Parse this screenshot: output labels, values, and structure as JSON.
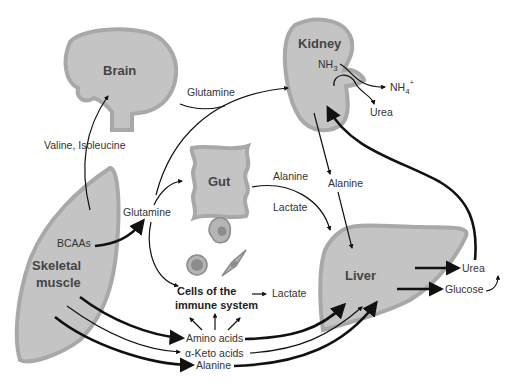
{
  "organs": {
    "brain": "Brain",
    "kidney": "Kidney",
    "gut": "Gut",
    "skeletal_muscle_line1": "Skeletal",
    "skeletal_muscle_line2": "muscle",
    "liver": "Liver",
    "immune_line1": "Cells of the",
    "immune_line2": "immune system"
  },
  "labels": {
    "valine_isoleucine": "Valine, Isoleucine",
    "glutamine_to_kidney": "Glutamine",
    "glutamine_center": "Glutamine",
    "bcaas": "BCAAs",
    "nh3_base": "NH",
    "nh3_sub": "3",
    "nh4_base": "NH",
    "nh4_sub": "4",
    "nh4_sup": "+",
    "kidney_urea": "Urea",
    "gut_alanine": "Alanine",
    "gut_lactate": "Lactate",
    "kidney_alanine": "Alanine",
    "immune_lactate": "Lactate",
    "amino_acids": "Amino acids",
    "alpha_keto_acids": "α-Keto acids",
    "alanine_bottom": "Alanine",
    "liver_urea": "Urea",
    "liver_glucose": "Glucose"
  },
  "colors": {
    "organ_fill": "#c4c4c4",
    "organ_stroke": "#a8a8a8",
    "arrow": "#111111",
    "text": "#333333"
  }
}
